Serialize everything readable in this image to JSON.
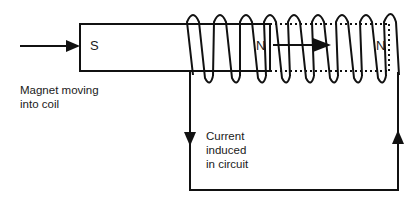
{
  "diagram": {
    "poles": {
      "magnet_left": "S",
      "magnet_right": "N",
      "coil_end": "N"
    },
    "labels": {
      "magnet_caption_line1": "Magnet moving",
      "magnet_caption_line2": "into coil",
      "current_line1": "Current",
      "current_line2": "induced",
      "current_line3": "in circuit"
    },
    "colors": {
      "line": "#111111",
      "background": "#ffffff"
    }
  }
}
